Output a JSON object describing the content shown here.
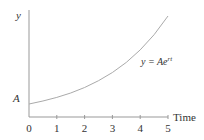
{
  "chart_data": {
    "type": "line",
    "title": "",
    "xlabel": "Time",
    "ylabel": "y",
    "x_ticks": [
      "0",
      "1",
      "2",
      "3",
      "4",
      "5"
    ],
    "y_tick_labels": [
      "A"
    ],
    "xlim": [
      0,
      5
    ],
    "grid": false,
    "legend": "none",
    "annotation": "y = Ae^rt",
    "series": [
      {
        "name": "y = Ae^rt",
        "x": [
          0,
          0.5,
          1,
          1.5,
          2,
          2.5,
          3,
          3.5,
          4,
          4.5,
          5
        ],
        "values": [
          1.0,
          1.23,
          1.51,
          1.85,
          2.27,
          2.79,
          3.42,
          4.2,
          5.16,
          6.33,
          7.77
        ],
        "note": "values in units of A, r ≈ 0.41"
      }
    ]
  },
  "labels": {
    "y_axis": "y",
    "x_axis": "Time",
    "a_mark": "A",
    "equation_prefix": "y = Ae",
    "equation_exp": "rt"
  }
}
